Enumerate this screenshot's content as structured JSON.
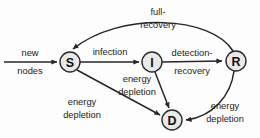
{
  "diagram": {
    "type": "state-transition-diagram",
    "background_color": "#fdfdfd",
    "stroke_color": "#26262b",
    "node_fill_color": "#e9e9e9",
    "node_border_color": "#2a2a2e",
    "text_color": "#1c1c20",
    "nodes": [
      {
        "id": "S",
        "label": "S",
        "cx": 70,
        "cy": 62,
        "r": 10
      },
      {
        "id": "I",
        "label": "I",
        "cx": 152,
        "cy": 62,
        "r": 10
      },
      {
        "id": "R",
        "label": "R",
        "cx": 236,
        "cy": 61,
        "r": 10
      },
      {
        "id": "D",
        "label": "D",
        "cx": 172,
        "cy": 120,
        "r": 10
      }
    ],
    "edges": [
      {
        "id": "entry",
        "from": "",
        "to": "S",
        "label_line1": "new",
        "label_line2": "nodes"
      },
      {
        "id": "s-to-i",
        "from": "S",
        "to": "I",
        "label_line1": "infection",
        "label_line2": ""
      },
      {
        "id": "i-to-r",
        "from": "I",
        "to": "R",
        "label_line1": "detection-",
        "label_line2": "recovery"
      },
      {
        "id": "r-to-s",
        "from": "R",
        "to": "S",
        "label_line1": "full-",
        "label_line2": "recovery"
      },
      {
        "id": "s-to-d",
        "from": "S",
        "to": "D",
        "label_line1": "energy",
        "label_line2": "depletion"
      },
      {
        "id": "i-to-d",
        "from": "I",
        "to": "D",
        "label_line1": "energy",
        "label_line2": "depletion"
      },
      {
        "id": "r-to-d",
        "from": "R",
        "to": "D",
        "label_line1": "energy",
        "label_line2": "depletion"
      }
    ],
    "labels": {
      "new": "new",
      "nodes": "nodes",
      "infection": "infection",
      "detection": "detection-",
      "recovery": "recovery",
      "full": "full-",
      "full_recovery": "recovery",
      "energy_1": "energy",
      "depletion_1": "depletion",
      "energy_2": "energy",
      "depletion_2": "depletion",
      "energy_3": "energy",
      "depletion_3": "depletion"
    }
  }
}
